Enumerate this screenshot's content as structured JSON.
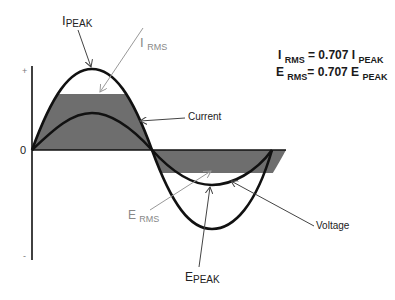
{
  "diagram": {
    "axis": {
      "plus_label": "+",
      "zero_label": "0",
      "minus_label": "-"
    },
    "labels": {
      "i_peak": {
        "main": "I",
        "sub": "PEAK"
      },
      "i_rms": {
        "main": "I",
        "sub": "RMS"
      },
      "current": "Current",
      "e_rms": {
        "main": "E",
        "sub": "RMS"
      },
      "e_peak": {
        "main": "E",
        "sub": "PEAK"
      },
      "voltage": "Voltage"
    },
    "equations": [
      {
        "lhs_main": "I",
        "lhs_sub": "RMS",
        "op": "= 0.707",
        "rhs_main": "I",
        "rhs_sub": "PEAK"
      },
      {
        "lhs_main": "E",
        "lhs_sub": "RMS",
        "op": "= 0.707",
        "rhs_main": "E",
        "rhs_sub": "PEAK"
      }
    ],
    "colors": {
      "curve": "#111111",
      "rms_fill": "#6e6e6e",
      "gray_label": "#888888",
      "arrow": "#444444"
    }
  }
}
